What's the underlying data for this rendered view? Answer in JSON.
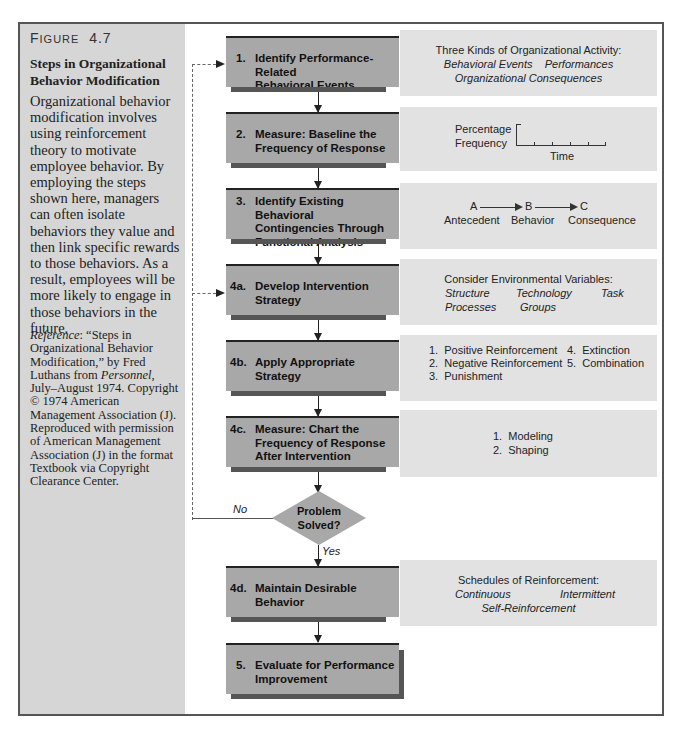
{
  "figure": {
    "label_first": "F",
    "label_rest": "IGURE",
    "number": "4.7",
    "title": "Steps in Organizational Behavior Modification",
    "description": "Organizational behavior modification involves using reinforcement theory to motivate employee behavior. By employing the steps shown here, managers can often isolate behaviors they value and then link specific rewards to those behaviors. As a result, employees will be more likely to engage in those behaviors in the future.",
    "reference_label": "Reference",
    "reference_part1": ": “Steps in Organizational Behavior Modification,” by Fred Luthans from ",
    "reference_journal": "Personnel",
    "reference_part2": ", July–August 1974. Copyright © 1974 American Management Association (J). Reproduced with permission of American Management Association (J) in the format Textbook via Copyright Clearance Center."
  },
  "steps": [
    {
      "num": "1.",
      "line1": "Identify Performance-Related",
      "line2": "Behavioral Events"
    },
    {
      "num": "2.",
      "line1": "Measure: Baseline the",
      "line2": "Frequency of Response"
    },
    {
      "num": "3.",
      "line1": "Identify Existing Behavioral",
      "line2": "Contingencies Through",
      "line3": "Functional Analysis"
    },
    {
      "num": "4a.",
      "line1": "Develop Intervention",
      "line2": "Strategy"
    },
    {
      "num": "4b.",
      "line1": "Apply Appropriate",
      "line2": "Strategy"
    },
    {
      "num": "4c.",
      "line1": "Measure: Chart the",
      "line2": "Frequency of Response",
      "line3": "After Intervention"
    },
    {
      "num": "4d.",
      "line1": "Maintain Desirable",
      "line2": "Behavior"
    },
    {
      "num": "5.",
      "line1": "Evaluate for Performance",
      "line2": "Improvement"
    }
  ],
  "decision": {
    "line1": "Problem",
    "line2": "Solved?",
    "no_label": "No",
    "yes_label": "Yes"
  },
  "info": {
    "activity": {
      "heading": "Three Kinds of Organizational Activity:",
      "item1": "Behavioral Events",
      "item2": "Performances",
      "item3": "Organizational Consequences"
    },
    "baseline": {
      "ylabel1": "Percentage",
      "ylabel2": "Frequency",
      "xlabel": "Time"
    },
    "abc": {
      "a": "A",
      "b": "B",
      "c": "C",
      "a_label": "Antecedent",
      "b_label": "Behavior",
      "c_label": "Consequence"
    },
    "environment": {
      "heading": "Consider Environmental Variables:",
      "v1": "Structure",
      "v2": "Technology",
      "v3": "Task",
      "v4": "Processes",
      "v5": "Groups"
    },
    "strategies": [
      "1.  Positive Reinforcement",
      "2.  Negative Reinforcement",
      "3.  Punishment",
      "4.  Extinction",
      "5.  Combination"
    ],
    "methods": [
      "1.  Modeling",
      "2.  Shaping"
    ],
    "schedules": {
      "heading": "Schedules of Reinforcement:",
      "s1": "Continuous",
      "s2": "Intermittent",
      "s3": "Self-Reinforcement"
    }
  }
}
